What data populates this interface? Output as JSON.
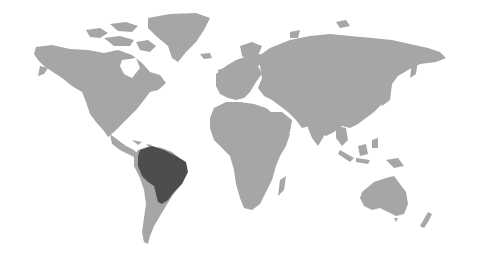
{
  "map": {
    "type": "world-map",
    "background_color": "#ffffff",
    "land_color": "#a6a6a6",
    "highlight_color": "#4d4d4d",
    "highlighted_regions": [
      {
        "name": "Brazil",
        "continent": "South America"
      }
    ],
    "continents": [
      "North America",
      "South America",
      "Europe",
      "Africa",
      "Asia",
      "Oceania"
    ]
  }
}
